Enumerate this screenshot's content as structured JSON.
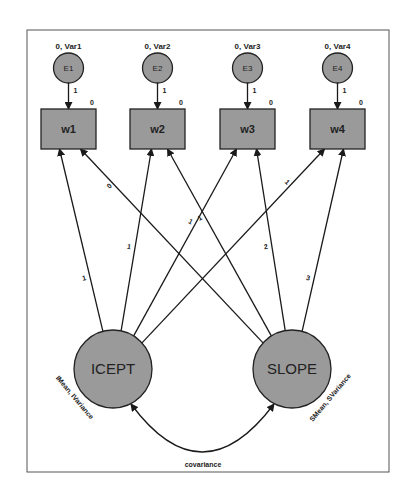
{
  "diagram": {
    "type": "structural-equation-model",
    "errors": [
      {
        "id": "E1",
        "label": "E1",
        "param": "0, Var1",
        "loading": "1"
      },
      {
        "id": "E2",
        "label": "E2",
        "param": "0, Var2",
        "loading": "1"
      },
      {
        "id": "E3",
        "label": "E3",
        "param": "0, Var3",
        "loading": "1"
      },
      {
        "id": "E4",
        "label": "E4",
        "param": "0, Var4",
        "loading": "1"
      }
    ],
    "observed": [
      {
        "id": "w1",
        "label": "w1",
        "intercept": "0"
      },
      {
        "id": "w2",
        "label": "w2",
        "intercept": "0"
      },
      {
        "id": "w3",
        "label": "w3",
        "intercept": "0"
      },
      {
        "id": "w4",
        "label": "w4",
        "intercept": "0"
      }
    ],
    "latent": [
      {
        "id": "ICEPT",
        "label": "ICEPT",
        "param": "IMean, IVariance"
      },
      {
        "id": "SLOPE",
        "label": "SLOPE",
        "param": "SMean, SVariance"
      }
    ],
    "paths": [
      {
        "from": "ICEPT",
        "to": "w1",
        "label": "1"
      },
      {
        "from": "ICEPT",
        "to": "w2",
        "label": "1"
      },
      {
        "from": "ICEPT",
        "to": "w3",
        "label": "1"
      },
      {
        "from": "ICEPT",
        "to": "w4",
        "label": "1"
      },
      {
        "from": "SLOPE",
        "to": "w1",
        "label": "0"
      },
      {
        "from": "SLOPE",
        "to": "w2",
        "label": "1"
      },
      {
        "from": "SLOPE",
        "to": "w3",
        "label": "2"
      },
      {
        "from": "SLOPE",
        "to": "w4",
        "label": "3"
      }
    ],
    "covariance": {
      "between": [
        "ICEPT",
        "SLOPE"
      ],
      "label": "covariance"
    }
  }
}
